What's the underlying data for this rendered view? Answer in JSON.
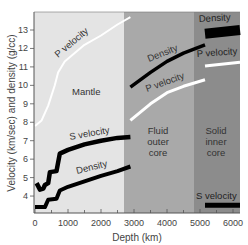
{
  "chart_data": {
    "type": "line",
    "title": "",
    "xlabel": "Depth (km)",
    "ylabel": "Velocity (km/sec) and density (g/cc)",
    "xlim": [
      0,
      6300
    ],
    "ylim": [
      3.1,
      14.0
    ],
    "x_ticks": [
      0,
      1000,
      2000,
      3000,
      4000,
      5000,
      6000
    ],
    "y_ticks": [
      4,
      5,
      6,
      7,
      8,
      9,
      10,
      11,
      12,
      13
    ],
    "grid": false,
    "legend": "none (inline curve labels)",
    "regions": [
      {
        "name": "Mantle",
        "x_start": 0,
        "x_end": 2890,
        "color": "#e4e4e4"
      },
      {
        "name": "Fluid outer core",
        "x_start": 2890,
        "x_end": 5150,
        "color": "#a9a9a9"
      },
      {
        "name": "Solid inner core",
        "x_start": 5150,
        "x_end": 6371,
        "color": "#8c8c8c"
      }
    ],
    "series": [
      {
        "name": "P velocity (mantle)",
        "color": "#ffffff",
        "points": [
          [
            0,
            7.8
          ],
          [
            200,
            8.1
          ],
          [
            400,
            8.9
          ],
          [
            600,
            10.0
          ],
          [
            700,
            10.7
          ],
          [
            900,
            11.3
          ],
          [
            1500,
            12.2
          ],
          [
            2000,
            12.7
          ],
          [
            2500,
            13.3
          ],
          [
            2890,
            13.7
          ]
        ]
      },
      {
        "name": "S velocity (mantle)",
        "color": "#000000",
        "points": [
          [
            50,
            4.7
          ],
          [
            150,
            4.35
          ],
          [
            250,
            4.4
          ],
          [
            300,
            4.6
          ],
          [
            400,
            4.7
          ],
          [
            450,
            5.3
          ],
          [
            650,
            5.35
          ],
          [
            750,
            6.3
          ],
          [
            1000,
            6.5
          ],
          [
            1500,
            6.8
          ],
          [
            2000,
            7.0
          ],
          [
            2500,
            7.15
          ],
          [
            2890,
            7.2
          ]
        ]
      },
      {
        "name": "Density (mantle)",
        "color": "#000000",
        "points": [
          [
            0,
            3.4
          ],
          [
            300,
            3.4
          ],
          [
            400,
            3.8
          ],
          [
            650,
            3.85
          ],
          [
            750,
            4.3
          ],
          [
            1000,
            4.5
          ],
          [
            1500,
            4.8
          ],
          [
            2000,
            5.1
          ],
          [
            2500,
            5.35
          ],
          [
            2890,
            5.6
          ]
        ]
      },
      {
        "name": "Density (outer core)",
        "color": "#000000",
        "points": [
          [
            2890,
            9.9
          ],
          [
            3500,
            10.7
          ],
          [
            4000,
            11.3
          ],
          [
            4500,
            11.75
          ],
          [
            5150,
            12.2
          ]
        ]
      },
      {
        "name": "P velocity (outer core)",
        "color": "#ffffff",
        "points": [
          [
            2890,
            8.1
          ],
          [
            3500,
            9.0
          ],
          [
            4000,
            9.6
          ],
          [
            4500,
            9.95
          ],
          [
            5150,
            10.3
          ]
        ]
      },
      {
        "name": "Density (inner core)",
        "color": "#000000",
        "points": [
          [
            5150,
            12.8
          ],
          [
            6371,
            13.0
          ]
        ]
      },
      {
        "name": "P velocity (inner core)",
        "color": "#ffffff",
        "points": [
          [
            5150,
            11.05
          ],
          [
            6371,
            11.25
          ]
        ]
      },
      {
        "name": "S velocity (inner core)",
        "color": "#000000",
        "points": [
          [
            5150,
            3.5
          ],
          [
            6371,
            3.5
          ]
        ]
      }
    ],
    "annotations": [
      {
        "text": "P velocity",
        "region": "mantle"
      },
      {
        "text": "Mantle",
        "region": "mantle"
      },
      {
        "text": "S velocity",
        "region": "mantle"
      },
      {
        "text": "Density",
        "region": "mantle"
      },
      {
        "text": "Density",
        "region": "outer core"
      },
      {
        "text": "P velocity",
        "region": "outer core"
      },
      {
        "text": "Fluid outer core",
        "region": "outer core"
      },
      {
        "text": "Density",
        "region": "inner core"
      },
      {
        "text": "P velocity",
        "region": "inner core"
      },
      {
        "text": "Solid inner core",
        "region": "inner core"
      },
      {
        "text": "S velocity",
        "region": "inner core"
      }
    ]
  },
  "labels": {
    "xlabel": "Depth (km)",
    "ylabel": "Velocity (km/sec) and density (g/cc)",
    "x_ticks": [
      "0",
      "1000",
      "2000",
      "3000",
      "4000",
      "5000",
      "6000"
    ],
    "y_ticks": [
      "4",
      "5",
      "6",
      "7",
      "8",
      "9",
      "10",
      "11",
      "12",
      "13"
    ],
    "mantle": {
      "region": "Mantle",
      "p_velocity": "P velocity",
      "s_velocity": "S velocity",
      "density": "Density"
    },
    "outer_core": {
      "line1": "Fluid",
      "line2": "outer",
      "line3": "core",
      "density": "Density",
      "p_velocity": "P velocity"
    },
    "inner_core": {
      "line1": "Solid",
      "line2": "inner",
      "line3": "core",
      "density": "Density",
      "p_velocity": "P velocity",
      "s_velocity": "S velocity"
    }
  }
}
